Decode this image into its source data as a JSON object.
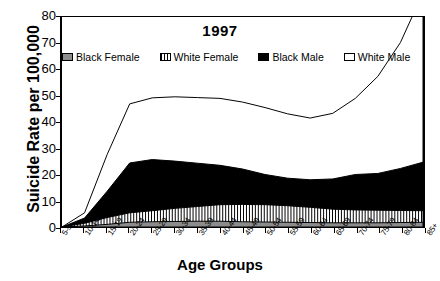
{
  "chart_data": {
    "type": "area",
    "title": "1997",
    "xlabel": "Age Groups",
    "ylabel": "Suicide Rate per 100,000",
    "ylim": [
      0,
      80
    ],
    "yticks": [
      0,
      10,
      20,
      30,
      40,
      50,
      60,
      70,
      80
    ],
    "grid": false,
    "legend_position": "top-inside",
    "stacked": false,
    "categories": [
      "5-9",
      "10-14",
      "15-19",
      "20-24",
      "25-29",
      "30-34",
      "35-39",
      "40-44",
      "45-49",
      "50-54",
      "55-59",
      "60-64",
      "65-69",
      "70-74",
      "75-79",
      "80-84",
      "85+"
    ],
    "series": [
      {
        "name": "Black Female",
        "fill": "#8c8c8c",
        "pattern": "solid-gray",
        "values": [
          0.0,
          0.4,
          1.0,
          1.8,
          2.0,
          2.1,
          2.2,
          2.2,
          2.0,
          1.9,
          1.8,
          1.7,
          1.6,
          1.6,
          1.6,
          1.7,
          1.8
        ]
      },
      {
        "name": "White Female",
        "fill": "#ffffff",
        "pattern": "vertical-hatch",
        "values": [
          0.0,
          1.0,
          2.6,
          3.6,
          4.2,
          5.0,
          5.6,
          6.3,
          6.6,
          6.6,
          6.3,
          5.8,
          5.2,
          4.9,
          4.8,
          4.6,
          4.4
        ]
      },
      {
        "name": "Black Male",
        "fill": "#000000",
        "pattern": "solid-black",
        "values": [
          0.0,
          2.0,
          10.0,
          19.0,
          19.5,
          18.0,
          16.5,
          15.0,
          13.5,
          11.5,
          10.5,
          10.5,
          11.5,
          13.5,
          14.0,
          16.0,
          18.5
        ]
      },
      {
        "name": "White Male",
        "fill": "#ffffff",
        "pattern": "open-line",
        "values": [
          0.0,
          2.0,
          14.0,
          22.5,
          23.5,
          24.5,
          25.0,
          25.5,
          25.5,
          25.5,
          24.5,
          23.5,
          25.0,
          29.0,
          37.0,
          48.0,
          64.5
        ]
      }
    ]
  },
  "legend": {
    "items": [
      {
        "label": "Black Female"
      },
      {
        "label": "White Female"
      },
      {
        "label": "Black Male"
      },
      {
        "label": "White Male"
      }
    ]
  }
}
